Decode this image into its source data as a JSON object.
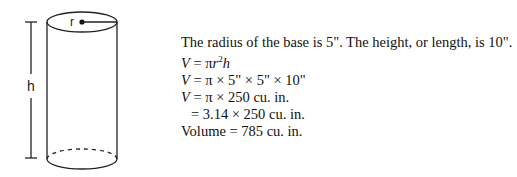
{
  "diagram": {
    "labels": {
      "radius": "r",
      "height": "h"
    }
  },
  "text": {
    "intro": "The radius of the base is 5\". The height, or length, is 10\".",
    "formula_V": "V",
    "formula_eq": " = πr",
    "formula_sup": "2",
    "formula_h": "h",
    "step1_V": "V",
    "step1_rest": " = π × 5\" × 5\" × 10\"",
    "step2_V": "V",
    "step2_rest": " = π × 250 cu. in.",
    "step3": "= 3.14 × 250 cu. in.",
    "result": "Volume = 785 cu. in."
  }
}
